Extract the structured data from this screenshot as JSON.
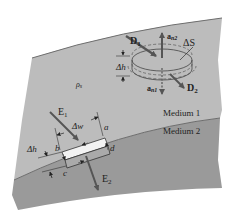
{
  "diagram": {
    "colors": {
      "background": "#ffffff",
      "medium1": "#bcbcbc",
      "medium2": "#9a9a9a",
      "boundary_line": "#6e6e6e",
      "arrow": "#555555",
      "text": "#222222"
    },
    "regions": {
      "medium1_label": "Medium 1",
      "medium2_label": "Medium 2"
    },
    "pillbox": {
      "D1": "D",
      "D1_sub": "1",
      "D2": "D",
      "D2_sub": "2",
      "an2": "a",
      "an2_sub": "n2",
      "an1": "a",
      "an1_sub": "n1",
      "dS": "ΔS",
      "dh": "Δh"
    },
    "charge_density": {
      "symbol": "ρ",
      "sub": "s"
    },
    "loop": {
      "E1": "E",
      "E1_sub": "1",
      "E2": "E",
      "E2_sub": "2",
      "dw": "Δw",
      "dh": "Δh",
      "corner_a": "a",
      "corner_b": "b",
      "corner_c": "c",
      "corner_d": "d"
    }
  }
}
